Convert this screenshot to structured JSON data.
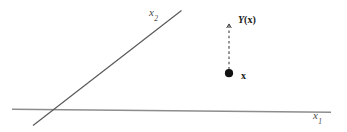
{
  "figure": {
    "type": "schematic-diagram",
    "background_color": "#ffffff",
    "width": 347,
    "height": 132
  },
  "axes": {
    "horizontal": {
      "name": "x1-axis",
      "label": "x",
      "subscript": "1",
      "color": "#8d8d8d",
      "start": [
        12,
        109
      ],
      "end": [
        331,
        112
      ],
      "label_position": [
        313,
        110
      ]
    },
    "vertical": {
      "name": "x2-axis",
      "label": "x",
      "subscript": "2",
      "color": "#555555",
      "start": [
        33,
        125
      ],
      "end": [
        181,
        11
      ],
      "label_position": [
        149,
        7
      ]
    }
  },
  "elements": {
    "point": {
      "name": "point-x",
      "label": "x",
      "color": "#111111",
      "center": [
        229,
        73
      ],
      "radius": 4.2,
      "label_position": [
        241,
        71
      ]
    },
    "image_point": {
      "name": "point-Y-of-x",
      "label_function": "Y",
      "label_open_paren": "(",
      "label_arg": "x",
      "label_close_paren": ")",
      "label_full": "Y(x)",
      "color": "#1a1a1a",
      "tip": [
        229,
        22
      ],
      "label_position": [
        238,
        15
      ]
    },
    "connector": {
      "name": "dashed-connector",
      "style": "dashed",
      "color": "#3a3a3a",
      "from": [
        229,
        70
      ],
      "to": [
        229,
        24
      ],
      "arrow_at": "to"
    }
  },
  "colors": {
    "axis_light": "#8d8d8d",
    "axis_dark": "#555555",
    "ink": "#1a1a1a",
    "label_gray": "#4a4a4a"
  }
}
